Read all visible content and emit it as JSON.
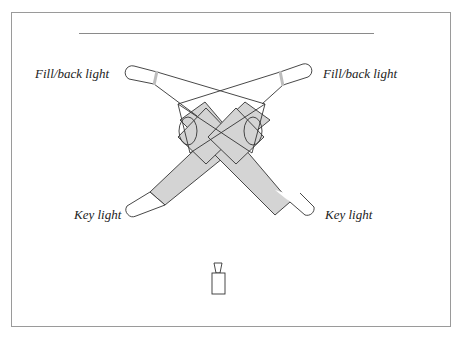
{
  "diagram": {
    "title_rule": true,
    "labels": {
      "fill_left": "Fill/back light",
      "fill_right": "Fill/back light",
      "key_left": "Key light",
      "key_right": "Key light"
    },
    "elements": {
      "subjects": 2,
      "camera": "camera-icon",
      "lights": [
        "fill-back-light-left",
        "fill-back-light-right",
        "key-light-left",
        "key-light-right"
      ]
    },
    "colors": {
      "beam_fill": "#d4d4d4",
      "stroke": "#333333",
      "band": "#bdbdbd",
      "frame": "#9a9a9a"
    }
  }
}
